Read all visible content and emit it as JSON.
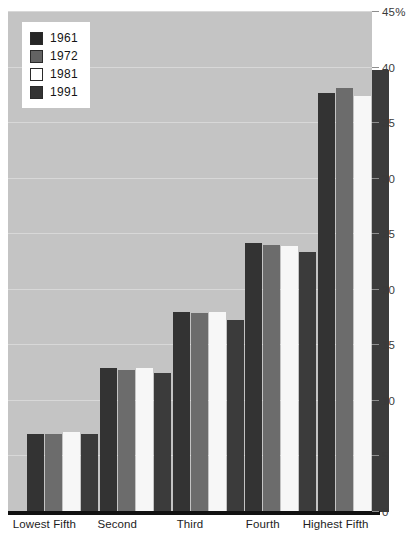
{
  "chart_data": {
    "type": "bar",
    "title": "",
    "xlabel": "",
    "ylabel": "",
    "ylim": [
      0,
      45
    ],
    "ytick_values": [
      0,
      5,
      10,
      15,
      20,
      25,
      30,
      35,
      40,
      45
    ],
    "ytick_labels": [
      "0",
      "5",
      "10",
      "15",
      "20",
      "25",
      "30",
      "35",
      "40",
      "45%"
    ],
    "grid": true,
    "legend_position": "top-left",
    "categories": [
      "Lowest Fifth",
      "Second",
      "Third",
      "Fourth",
      "Highest Fifth"
    ],
    "series": [
      {
        "name": "1961",
        "color": "#262626",
        "values": [
          7.0,
          13.0,
          18.0,
          24.2,
          37.7
        ]
      },
      {
        "name": "1972",
        "color": "#636363",
        "values": [
          7.0,
          12.8,
          17.9,
          24.0,
          38.2
        ]
      },
      {
        "name": "1981",
        "color": "#ffffff",
        "values": [
          7.2,
          13.0,
          18.0,
          23.9,
          37.4
        ]
      },
      {
        "name": "1991",
        "color": "#333333",
        "values": [
          7.0,
          12.5,
          17.3,
          23.4,
          39.8
        ]
      }
    ]
  },
  "legend": {
    "items": [
      {
        "label": "1961"
      },
      {
        "label": "1972"
      },
      {
        "label": "1981"
      },
      {
        "label": "1991"
      }
    ]
  },
  "colors": {
    "plot_background": "#c4c4c4",
    "gridline": "#d8d8d8",
    "axis_line": "#111111",
    "tick_text": "#3a3a3a",
    "category_text": "#1d1d1d"
  }
}
